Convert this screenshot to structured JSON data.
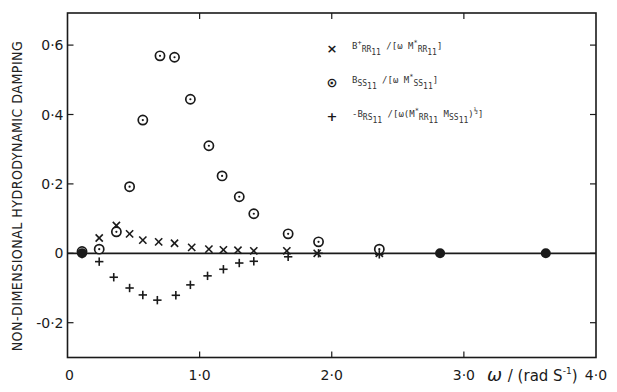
{
  "chart_data": {
    "type": "scatter",
    "title": "",
    "xlabel": "ω / (rad s⁻¹)",
    "ylabel": "NON-DIMENSIONAL HYDRODYNAMIC DAMPING",
    "xlim": [
      0,
      4.0
    ],
    "ylim": [
      -0.3,
      0.7
    ],
    "grid": false,
    "legend_position": "upper right",
    "x_ticks": [
      0,
      1.0,
      2.0,
      3.0,
      4.0
    ],
    "x_tick_labels": [
      "0",
      "1·0",
      "2·0",
      "3·0",
      "4·0"
    ],
    "y_ticks": [
      -0.2,
      0,
      0.2,
      0.4,
      0.6
    ],
    "y_tick_labels": [
      "-0·2",
      "0",
      "0·2",
      "0·4",
      "0·6"
    ],
    "series": [
      {
        "name": "B+RR11 / [ω M*RR11]",
        "marker": "x",
        "x": [
          0.11,
          0.24,
          0.37,
          0.47,
          0.57,
          0.69,
          0.81,
          0.94,
          1.07,
          1.18,
          1.29,
          1.41,
          1.66,
          1.89,
          2.36
        ],
        "y": [
          0.004,
          0.044,
          0.08,
          0.056,
          0.038,
          0.033,
          0.029,
          0.017,
          0.012,
          0.01,
          0.009,
          0.007,
          0.007,
          0.0,
          0.0
        ]
      },
      {
        "name": "BSS11 / [ω M*SS11]",
        "marker": "circle-dot",
        "x": [
          0.11,
          0.24,
          0.37,
          0.47,
          0.57,
          0.7,
          0.81,
          0.93,
          1.07,
          1.17,
          1.3,
          1.41,
          1.67,
          1.9,
          2.36
        ],
        "y": [
          0.005,
          0.012,
          0.062,
          0.192,
          0.384,
          0.569,
          0.565,
          0.444,
          0.31,
          0.223,
          0.163,
          0.114,
          0.056,
          0.033,
          0.012
        ]
      },
      {
        "name": "-BRS11 / [ω (M*RR11 MSS11)^½]",
        "marker": "+",
        "x": [
          0.11,
          0.24,
          0.35,
          0.47,
          0.57,
          0.68,
          0.82,
          0.93,
          1.06,
          1.18,
          1.3,
          1.41,
          1.67,
          1.9,
          2.36
        ],
        "y": [
          -0.002,
          -0.024,
          -0.069,
          -0.1,
          -0.12,
          -0.135,
          -0.121,
          -0.091,
          -0.065,
          -0.046,
          -0.028,
          -0.023,
          -0.01,
          0.0,
          -0.003
        ]
      },
      {
        "name": "coincident (all three ≈ 0)",
        "marker": "filled-circle",
        "x": [
          0.11,
          2.82,
          3.62
        ],
        "y": [
          0.0,
          0.0,
          0.0
        ]
      }
    ]
  },
  "axes": {
    "ylabel": "NON-DIMENSIONAL HYDRODYNAMIC DAMPING",
    "xlabel_omega": "ω",
    "xlabel_unit": "/ (rad S",
    "xlabel_exp": "-1",
    "xlabel_close": ")"
  },
  "legend": {
    "items": [
      {
        "marker": "×",
        "B": "B",
        "Bsup": "+",
        "Bsub": "RR",
        "Bsub2": "11",
        "rest": "/[ω M",
        "Msup": "*",
        "Msub": "RR",
        "Msub2": "11",
        "end": "]"
      },
      {
        "marker": "⊙",
        "B": "B",
        "Bsup": "",
        "Bsub": "SS",
        "Bsub2": "11",
        "rest": "/[ω M",
        "Msup": "*",
        "Msub": "SS",
        "Msub2": "11",
        "end": "]"
      },
      {
        "marker": "+",
        "text": "-B_RS11 /[ω(M*_RR11  M_SS11)^½]"
      }
    ]
  },
  "colors": {
    "ink": "#1a1a1a",
    "background": "#ffffff"
  }
}
